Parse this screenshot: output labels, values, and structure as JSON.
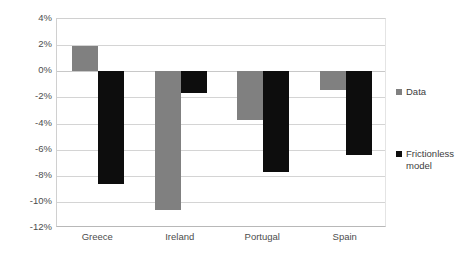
{
  "chart_data": {
    "type": "bar",
    "title": "",
    "subtitle": "",
    "xlabel": "",
    "ylabel": "",
    "categories": [
      "Greece",
      "Ireland",
      "Portugal",
      "Spain"
    ],
    "series": [
      {
        "name": "Data",
        "color": "#808080",
        "values": [
          1.9,
          -10.6,
          -3.7,
          -1.45
        ]
      },
      {
        "name": "Frictionless model",
        "color": "#0d0d0d",
        "values": [
          -8.6,
          -1.7,
          -7.7,
          -6.4
        ]
      }
    ],
    "ylim": [
      -12,
      4
    ],
    "ytick_step": 2,
    "ytick_labels": [
      "4%",
      "2%",
      "0%",
      "-2%",
      "-4%",
      "-6%",
      "-8%",
      "-10%",
      "-12%"
    ],
    "ytick_values": [
      4,
      2,
      0,
      -2,
      -4,
      -6,
      -8,
      -10,
      -12
    ],
    "grid": true,
    "grid_axis": "y",
    "legend_position": "right",
    "value_unit": "percent",
    "baseline": 0
  },
  "legend": {
    "entries": [
      {
        "label": "Data",
        "swatch_color": "#808080"
      },
      {
        "label": "Frictionless model",
        "swatch_color": "#0d0d0d"
      }
    ]
  },
  "axes": {
    "y": {
      "min_label": "-12%",
      "max_label": "4%"
    }
  }
}
